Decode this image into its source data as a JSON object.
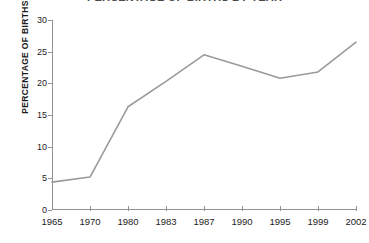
{
  "figure": {
    "title_remnant": "PERCENTAGE OF BIRTHS BY YEAR",
    "line_color": "#9a9a9a",
    "axis_color": "#939393"
  },
  "chart_data": {
    "type": "line",
    "title": "",
    "xlabel": "",
    "ylabel": "PERCENTAGE OF BIRTHS",
    "categories": [
      "1965",
      "1970",
      "1980",
      "1983",
      "1987",
      "1990",
      "1995",
      "1999",
      "2002"
    ],
    "values": [
      4.4,
      5.2,
      16.3,
      20.3,
      24.5,
      22.7,
      20.8,
      21.8,
      26.5
    ],
    "ylim": [
      0,
      30
    ],
    "yticks": [
      0,
      5,
      10,
      15,
      20,
      25,
      30
    ],
    "ytick_labels": [
      "0",
      "5",
      "10",
      "15",
      "20",
      "25",
      "30"
    ],
    "grid": false,
    "legend": "none",
    "series": [
      {
        "name": "Percentage of births",
        "color": "#9a9a9a",
        "values": [
          4.4,
          5.2,
          16.3,
          20.3,
          24.5,
          22.7,
          20.8,
          21.8,
          26.5
        ]
      }
    ]
  }
}
